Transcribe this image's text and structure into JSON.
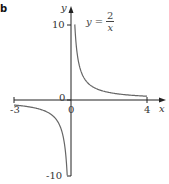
{
  "figure": {
    "part_label": "b",
    "equation": {
      "lhs": "y",
      "eq": "=",
      "numerator": "2",
      "denominator": "x"
    }
  },
  "chart_data": {
    "type": "line",
    "xlabel": "x",
    "ylabel": "y",
    "xlim": [
      -3,
      4
    ],
    "ylim": [
      -10,
      10
    ],
    "x_ticks": [
      "-3",
      "0",
      "4"
    ],
    "y_ticks": [
      "10",
      "0",
      "-10"
    ],
    "grid": false,
    "legend": null,
    "annotations": [
      "y = 2/x"
    ],
    "series": [
      {
        "name": "y = 2/x (x > 0)",
        "x": [
          0.2,
          0.25,
          0.3,
          0.4,
          0.5,
          0.75,
          1,
          1.5,
          2,
          2.5,
          3,
          3.5,
          4
        ],
        "y": [
          10,
          8,
          6.67,
          5,
          4,
          2.67,
          2,
          1.33,
          1,
          0.8,
          0.67,
          0.57,
          0.5
        ]
      },
      {
        "name": "y = 2/x (x < 0)",
        "x": [
          -3,
          -2.5,
          -2,
          -1.5,
          -1,
          -0.75,
          -0.5,
          -0.4,
          -0.3,
          -0.25,
          -0.2
        ],
        "y": [
          -0.67,
          -0.8,
          -1,
          -1.33,
          -2,
          -2.67,
          -4,
          -5,
          -6.67,
          -8,
          -10
        ]
      }
    ]
  },
  "colors": {
    "axis": "#222222",
    "curve": "#666666",
    "text": "#333333"
  }
}
